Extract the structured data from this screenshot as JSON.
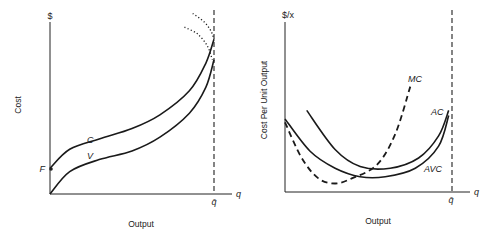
{
  "chart_data": [
    {
      "type": "line",
      "title": "",
      "xlabel": "Output",
      "ylabel": "Cost",
      "y_unit_label": "$",
      "x_axis_symbol": "q",
      "capacity_label": "q̄",
      "fixed_cost_label": "F",
      "xlim": [
        0,
        1
      ],
      "ylim": [
        0,
        1
      ],
      "capacity_x": 1.0,
      "fixed_cost_value": 0.15,
      "series": [
        {
          "name": "C",
          "label": "C",
          "style": "solid",
          "points": [
            [
              0.0,
              0.15
            ],
            [
              0.12,
              0.26
            ],
            [
              0.3,
              0.32
            ],
            [
              0.5,
              0.38
            ],
            [
              0.67,
              0.46
            ],
            [
              0.85,
              0.6
            ],
            [
              0.95,
              0.76
            ],
            [
              1.0,
              0.9
            ]
          ]
        },
        {
          "name": "V",
          "label": "V",
          "style": "solid",
          "points": [
            [
              0.0,
              0.0
            ],
            [
              0.12,
              0.13
            ],
            [
              0.3,
              0.2
            ],
            [
              0.5,
              0.25
            ],
            [
              0.67,
              0.33
            ],
            [
              0.85,
              0.47
            ],
            [
              0.95,
              0.62
            ],
            [
              1.0,
              0.78
            ]
          ]
        },
        {
          "name": "C-extension",
          "label": "",
          "style": "dotted",
          "points": [
            [
              0.87,
              1.05
            ],
            [
              0.94,
              1.0
            ],
            [
              0.98,
              0.95
            ],
            [
              1.0,
              0.9
            ]
          ]
        },
        {
          "name": "V-extension",
          "label": "",
          "style": "dotted",
          "points": [
            [
              0.82,
              0.97
            ],
            [
              0.9,
              0.93
            ],
            [
              0.96,
              0.86
            ],
            [
              0.99,
              0.78
            ]
          ]
        }
      ]
    },
    {
      "type": "line",
      "title": "",
      "xlabel": "Output",
      "ylabel": "Cost Per Unit Output",
      "y_unit_label": "$/x",
      "x_axis_symbol": "q",
      "capacity_label": "q̄",
      "xlim": [
        0,
        1
      ],
      "ylim": [
        0,
        1
      ],
      "capacity_x": 1.0,
      "series": [
        {
          "name": "AC",
          "label": "AC",
          "style": "solid",
          "points": [
            [
              0.13,
              0.48
            ],
            [
              0.3,
              0.25
            ],
            [
              0.45,
              0.15
            ],
            [
              0.63,
              0.14
            ],
            [
              0.8,
              0.2
            ],
            [
              0.92,
              0.33
            ],
            [
              0.98,
              0.48
            ]
          ]
        },
        {
          "name": "AVC",
          "label": "AVC",
          "style": "solid",
          "points": [
            [
              0.0,
              0.43
            ],
            [
              0.15,
              0.24
            ],
            [
              0.3,
              0.14
            ],
            [
              0.45,
              0.09
            ],
            [
              0.6,
              0.09
            ],
            [
              0.78,
              0.14
            ],
            [
              0.92,
              0.27
            ],
            [
              0.98,
              0.45
            ]
          ]
        },
        {
          "name": "MC",
          "label": "MC",
          "style": "dashed",
          "points": [
            [
              0.0,
              0.41
            ],
            [
              0.1,
              0.2
            ],
            [
              0.2,
              0.08
            ],
            [
              0.3,
              0.05
            ],
            [
              0.4,
              0.08
            ],
            [
              0.55,
              0.16
            ],
            [
              0.66,
              0.34
            ],
            [
              0.75,
              0.62
            ]
          ]
        }
      ]
    }
  ]
}
